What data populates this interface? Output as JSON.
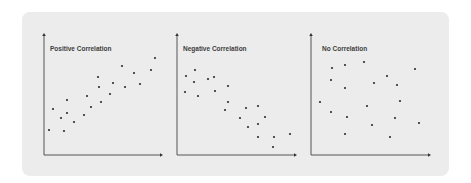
{
  "panel": {
    "background": "#ececec",
    "dot_color": "#2e2e2e",
    "axis_color": "#555555",
    "title_color": "#3d3d3d"
  },
  "chart_data": [
    {
      "type": "scatter",
      "title": "Positive Correlation",
      "xlabel": "",
      "ylabel": "",
      "grid": false,
      "axes": {
        "origin": [
          44,
          155
        ],
        "x_end": 163,
        "y_top": 33
      },
      "points": [
        [
          49,
          130
        ],
        [
          53,
          109
        ],
        [
          61,
          118
        ],
        [
          64,
          131
        ],
        [
          67,
          100
        ],
        [
          67,
          113
        ],
        [
          74,
          122
        ],
        [
          84,
          115
        ],
        [
          87,
          96
        ],
        [
          91,
          107
        ],
        [
          98,
          77
        ],
        [
          99,
          87
        ],
        [
          101,
          102
        ],
        [
          110,
          94
        ],
        [
          113,
          83
        ],
        [
          122,
          66
        ],
        [
          125,
          87
        ],
        [
          134,
          73
        ],
        [
          140,
          84
        ],
        [
          151,
          70
        ],
        [
          155,
          58
        ]
      ]
    },
    {
      "type": "scatter",
      "title": "Negative Correlation",
      "xlabel": "",
      "ylabel": "",
      "grid": false,
      "axes": {
        "origin": [
          177,
          155
        ],
        "x_end": 297,
        "y_top": 33
      },
      "points": [
        [
          185,
          92
        ],
        [
          186,
          76
        ],
        [
          194,
          82
        ],
        [
          195,
          70
        ],
        [
          198,
          96
        ],
        [
          208,
          79
        ],
        [
          214,
          77
        ],
        [
          215,
          91
        ],
        [
          228,
          86
        ],
        [
          228,
          102
        ],
        [
          225,
          110
        ],
        [
          240,
          118
        ],
        [
          246,
          108
        ],
        [
          248,
          127
        ],
        [
          258,
          106
        ],
        [
          258,
          124
        ],
        [
          265,
          117
        ],
        [
          258,
          137
        ],
        [
          274,
          137
        ],
        [
          273,
          147
        ],
        [
          290,
          134
        ]
      ]
    },
    {
      "type": "scatter",
      "title": "No Correlation",
      "xlabel": "",
      "ylabel": "",
      "grid": false,
      "axes": {
        "origin": [
          311,
          155
        ],
        "x_end": 431,
        "y_top": 33
      },
      "points": [
        [
          320,
          102
        ],
        [
          331,
          80
        ],
        [
          332,
          68
        ],
        [
          331,
          112
        ],
        [
          345,
          65
        ],
        [
          345,
          88
        ],
        [
          347,
          117
        ],
        [
          345,
          134
        ],
        [
          364,
          62
        ],
        [
          374,
          83
        ],
        [
          367,
          106
        ],
        [
          372,
          125
        ],
        [
          387,
          76
        ],
        [
          397,
          85
        ],
        [
          395,
          118
        ],
        [
          400,
          101
        ],
        [
          390,
          137
        ],
        [
          415,
          69
        ],
        [
          419,
          123
        ]
      ]
    }
  ]
}
